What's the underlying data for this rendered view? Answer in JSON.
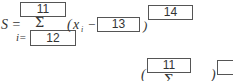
{
  "formula": {
    "lhs": "S =",
    "sum_symbol": "Σ",
    "index_label": "i=",
    "open_paren": "(",
    "variable": "x",
    "variable_subscript": "i",
    "minus": "−",
    "close_paren": ")",
    "boxes": {
      "upper_limit": "11",
      "lower_limit": "12",
      "subtrahend": "13",
      "exponent": "14"
    }
  },
  "second_line": {
    "open_paren": "(",
    "upper_limit_box": "11",
    "sum_symbol": "Σ",
    "close_paren": ")",
    "partial_box": ""
  }
}
